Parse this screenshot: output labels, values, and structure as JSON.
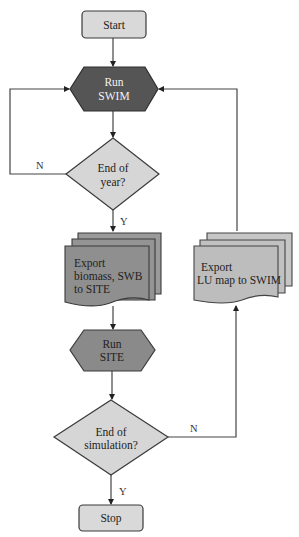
{
  "diagram": {
    "type": "flowchart",
    "nodes": {
      "start": {
        "label": "Start",
        "shape": "rounded-rect",
        "fill": "#d9d9d9"
      },
      "run_swim": {
        "line1": "Run",
        "line2": "SWIM",
        "shape": "hexagon",
        "fill": "#555555"
      },
      "end_of_year": {
        "line1": "End of",
        "line2": "year?",
        "shape": "diamond",
        "fill": "#d6d6d6"
      },
      "export_biomass": {
        "line1": "Export",
        "line2": "biomass, SWB",
        "line3": "to SITE",
        "shape": "multi-document",
        "fill": "#8f8f8f"
      },
      "run_site": {
        "line1": "Run",
        "line2": "SITE",
        "shape": "hexagon",
        "fill": "#8a8a8a"
      },
      "end_of_simulation": {
        "line1": "End of",
        "line2": "simulation?",
        "shape": "diamond",
        "fill": "#d6d6d6"
      },
      "export_lu_map": {
        "line1": "Export",
        "line2": "LU map to SWIM",
        "shape": "multi-document",
        "fill": "#bdbdbd"
      },
      "stop": {
        "label": "Stop",
        "shape": "rounded-rect",
        "fill": "#d9d9d9"
      }
    },
    "edges": [
      {
        "from": "start",
        "to": "run_swim",
        "label": ""
      },
      {
        "from": "run_swim",
        "to": "end_of_year",
        "label": ""
      },
      {
        "from": "end_of_year",
        "to": "run_swim",
        "label": "N"
      },
      {
        "from": "end_of_year",
        "to": "export_biomass",
        "label": "Y"
      },
      {
        "from": "export_biomass",
        "to": "run_site",
        "label": ""
      },
      {
        "from": "run_site",
        "to": "end_of_simulation",
        "label": ""
      },
      {
        "from": "end_of_simulation",
        "to": "export_lu_map",
        "label": "N"
      },
      {
        "from": "export_lu_map",
        "to": "run_swim",
        "label": ""
      },
      {
        "from": "end_of_simulation",
        "to": "stop",
        "label": "Y"
      }
    ],
    "edge_labels": {
      "year_no": "N",
      "year_yes": "Y",
      "sim_no": "N",
      "sim_yes": "Y"
    },
    "colors": {
      "stroke": "#3a3a3a",
      "line": "#444444"
    }
  }
}
